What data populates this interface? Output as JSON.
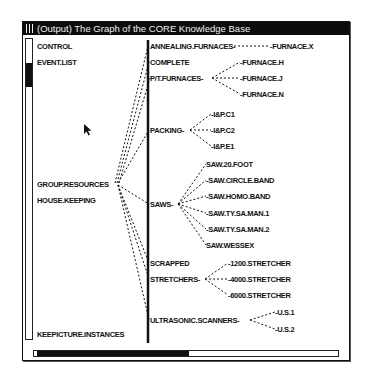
{
  "window": {
    "title": "(Output) The Graph of the CORE Knowledge Base"
  },
  "graph": {
    "roots": [
      {
        "id": "control",
        "label": "CONTROL",
        "x": 37,
        "y": 42
      },
      {
        "id": "event_list",
        "label": "EVENT.LIST",
        "x": 37,
        "y": 58
      },
      {
        "id": "group_resources",
        "label": "GROUP.RESOURCES",
        "x": 37,
        "y": 180
      },
      {
        "id": "house_keeping",
        "label": "HOUSE.KEEPING",
        "x": 37,
        "y": 196
      },
      {
        "id": "keepicture_instances",
        "label": "KEEPICTURE.INSTANCES",
        "x": 37,
        "y": 330
      }
    ],
    "level1": [
      {
        "id": "annealing",
        "label": "ANNEALING.FURNACES-",
        "x": 150,
        "y": 42
      },
      {
        "id": "complete",
        "label": "COMPLETE",
        "x": 150,
        "y": 58
      },
      {
        "id": "pt_furnaces",
        "label": "P/T.FURNACES-",
        "x": 150,
        "y": 74
      },
      {
        "id": "packing",
        "label": "PACKING-",
        "x": 150,
        "y": 126
      },
      {
        "id": "saws",
        "label": "SAWS-",
        "x": 150,
        "y": 200
      },
      {
        "id": "scrapped",
        "label": "SCRAPPED",
        "x": 150,
        "y": 259
      },
      {
        "id": "stretchers",
        "label": "STRETCHERS-",
        "x": 150,
        "y": 275
      },
      {
        "id": "ultrasonic",
        "label": "ULTRASONIC.SCANNERS-",
        "x": 150,
        "y": 316
      }
    ],
    "level2": [
      {
        "parent": "annealing",
        "label": "-FURNACE.X",
        "x": 270,
        "y": 42
      },
      {
        "parent": "pt_furnaces",
        "label": "-FURNACE.H",
        "x": 240,
        "y": 58
      },
      {
        "parent": "pt_furnaces",
        "label": "-FURNACE.J",
        "x": 240,
        "y": 74
      },
      {
        "parent": "pt_furnaces",
        "label": "-FURNACE.N",
        "x": 240,
        "y": 90
      },
      {
        "parent": "packing",
        "label": "-I&P.C1",
        "x": 211,
        "y": 110
      },
      {
        "parent": "packing",
        "label": "-I&P.C2",
        "x": 211,
        "y": 126
      },
      {
        "parent": "packing",
        "label": "-I&P.E1",
        "x": 211,
        "y": 142
      },
      {
        "parent": "saws",
        "label": "SAW.20.FOOT",
        "x": 206,
        "y": 160
      },
      {
        "parent": "saws",
        "label": "-SAW.CIRCLE.BAND",
        "x": 206,
        "y": 176
      },
      {
        "parent": "saws",
        "label": "-SAW.HOMO.BAND",
        "x": 206,
        "y": 192
      },
      {
        "parent": "saws",
        "label": "-SAW.TY.SA.MAN.1",
        "x": 206,
        "y": 209
      },
      {
        "parent": "saws",
        "label": "-SAW.TY.SA.MAN.2",
        "x": 206,
        "y": 225
      },
      {
        "parent": "saws",
        "label": "SAW.WESSEX",
        "x": 206,
        "y": 241
      },
      {
        "parent": "stretchers",
        "label": "-1200.STRETCHER",
        "x": 228,
        "y": 259
      },
      {
        "parent": "stretchers",
        "label": "-4000.STRETCHER",
        "x": 228,
        "y": 275
      },
      {
        "parent": "stretchers",
        "label": "-6000.STRETCHER",
        "x": 228,
        "y": 291
      },
      {
        "parent": "ultrasonic",
        "label": "-U.S.1",
        "x": 275,
        "y": 308
      },
      {
        "parent": "ultrasonic",
        "label": "-U.S.2",
        "x": 275,
        "y": 325
      }
    ]
  }
}
